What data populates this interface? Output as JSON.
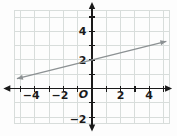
{
  "figure": {
    "background": "#fdfdfd",
    "axis_color": "#1a1a1a",
    "label_color": "#1a1a1a"
  },
  "chart_data": {
    "type": "line",
    "title": "",
    "xlabel": "",
    "ylabel": "",
    "grid": {
      "on": true,
      "color": "#d8dddb",
      "background": "#fdfdfd",
      "step": 1,
      "x_range": [
        -5.4,
        5.4
      ],
      "y_range": [
        -2.45,
        5.45
      ]
    },
    "axes": {
      "x": {
        "range": [
          -6.2,
          5.6
        ],
        "ticks": [
          -5,
          -4,
          -3,
          -2,
          -1,
          1,
          2,
          3,
          4,
          5
        ],
        "labeled_ticks": [
          {
            "value": -4,
            "label": "−4"
          },
          {
            "value": -2,
            "label": "−2"
          },
          {
            "value": 2,
            "label": "2"
          },
          {
            "value": 4,
            "label": "4"
          }
        ]
      },
      "y": {
        "range": [
          -3.0,
          6.05
        ],
        "ticks": [
          -2,
          -1,
          1,
          2,
          3,
          4,
          5
        ],
        "labeled_ticks": [
          {
            "value": 4,
            "label": "4"
          },
          {
            "value": 2,
            "label": "2"
          },
          {
            "value": -2,
            "label": "−2"
          }
        ]
      },
      "origin_label": "O"
    },
    "series": [
      {
        "name": "plotted-line",
        "equation": "y = 0.25x + 2",
        "slope": 0.25,
        "y_intercept": 2,
        "x_start": -5.25,
        "x_end": 5.2,
        "arrows": "both",
        "color": "#8c9193",
        "points_on_line": [
          [
            -4,
            1
          ],
          [
            0,
            2
          ],
          [
            4,
            3
          ]
        ]
      }
    ]
  }
}
